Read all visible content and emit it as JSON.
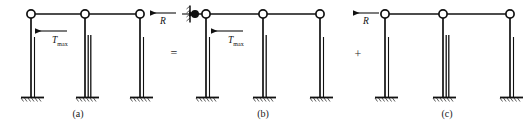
{
  "figure": {
    "type": "structural-mechanics-diagram",
    "background": "#ffffff",
    "stroke_color": "#111111",
    "frames": [
      {
        "id": "a",
        "caption": "(a)",
        "load_label": {
          "symbol": "T",
          "subscript": "max",
          "direction": "left"
        },
        "reaction_label": {
          "symbol": "R",
          "direction": "left"
        },
        "support_wall": false,
        "columns": 3,
        "base_support": "fixed"
      },
      {
        "id": "b",
        "caption": "(b)",
        "load_label": {
          "symbol": "T",
          "subscript": "max",
          "direction": "left"
        },
        "reaction_label": null,
        "support_wall": true,
        "columns": 3,
        "base_support": "fixed"
      },
      {
        "id": "c",
        "caption": "(c)",
        "load_label": null,
        "reaction_label": {
          "symbol": "R",
          "direction": "left"
        },
        "support_wall": false,
        "columns": 3,
        "base_support": "fixed"
      }
    ],
    "operators": [
      {
        "symbol": "=",
        "between": [
          "a",
          "b"
        ]
      },
      {
        "symbol": "+",
        "between": [
          "b",
          "c"
        ]
      }
    ]
  }
}
